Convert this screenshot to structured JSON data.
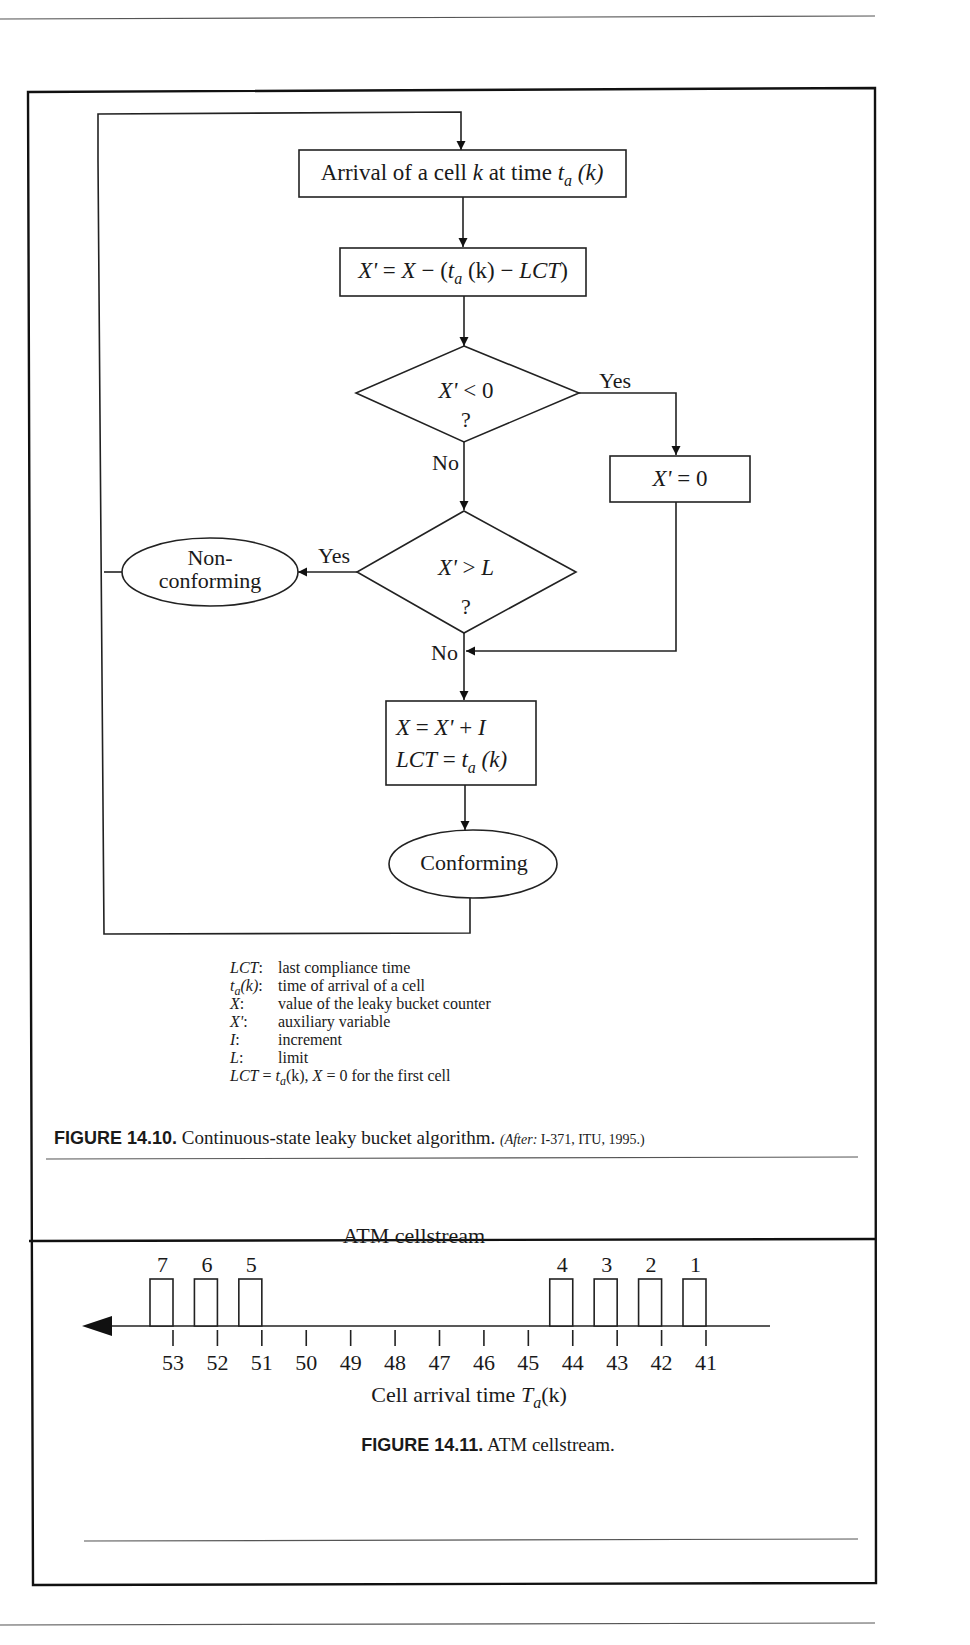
{
  "figure_14_10": {
    "nodes": {
      "arrival": {
        "pre": "Arrival of a cell ",
        "k": "k",
        "mid": " at time ",
        "t": "t",
        "sub": "a",
        "post": " (k)"
      },
      "compute": {
        "xp": "X'",
        "eq": " = ",
        "x": "X",
        "minus": " − (",
        "t": "t",
        "sub": "a",
        "k": " (k) − ",
        "lct": "LCT",
        "close": ")"
      },
      "decision1": {
        "lhs": "X'",
        "op": " < 0",
        "q": "?"
      },
      "reset": {
        "lhs": "X'",
        "rhs": " = 0"
      },
      "decision2": {
        "lhs": "X'",
        "op": " > ",
        "rhs": "L",
        "q": "?"
      },
      "update": {
        "line1": {
          "x": "X",
          "eq": " = ",
          "xp": "X'",
          "plus": " + ",
          "i": "I"
        },
        "line2": {
          "lct": "LCT",
          "eq": " = ",
          "t": "t",
          "sub": "a",
          "k": " (k)"
        }
      },
      "nonconforming": {
        "line1": "Non-",
        "line2": "conforming"
      },
      "conforming": {
        "label": "Conforming"
      }
    },
    "edge_labels": {
      "d1_yes": "Yes",
      "d1_no": "No",
      "d2_yes": "Yes",
      "d2_no": "No"
    },
    "legend": [
      {
        "sym": "LCT",
        "colon": ":",
        "desc": "last compliance time"
      },
      {
        "sym": "t",
        "sub": "a",
        "arg": "(k)",
        "colon": ":",
        "desc": "time of arrival of a cell"
      },
      {
        "sym": "X",
        "colon": ":",
        "desc": "value of the leaky bucket counter"
      },
      {
        "sym": "X'",
        "colon": ":",
        "desc": "auxiliary variable"
      },
      {
        "sym": "I",
        "colon": ":",
        "desc": "increment"
      },
      {
        "sym": "L",
        "colon": ":",
        "desc": "limit"
      }
    ],
    "legend_footer": {
      "lct": "LCT",
      "eq1": " = ",
      "t": "t",
      "sub": "a",
      "arg": "(k), ",
      "x": "X",
      "rest": " = 0 for the first cell"
    },
    "caption": {
      "label": "FIGURE 14.10.",
      "text": " Continuous-state leaky bucket algorithm. ",
      "after_label": "(After:",
      "after_text": " I-371, ITU, 1995.)"
    }
  },
  "figure_14_11": {
    "caption": {
      "label": "FIGURE 14.11.",
      "text": " ATM cellstream."
    }
  },
  "chart_data": {
    "type": "timeline",
    "title": "ATM cellstream",
    "xlabel": "Cell arrival time T_a(k)",
    "xlabel_parts": {
      "pre": "Cell arrival time ",
      "T": "T",
      "sub": "a",
      "post": "(k)"
    },
    "direction": "right-to-left (arrow points left)",
    "ticks": [
      53,
      52,
      51,
      50,
      49,
      48,
      47,
      46,
      45,
      44,
      43,
      42,
      41
    ],
    "cells": [
      {
        "id": "7",
        "time": 53
      },
      {
        "id": "6",
        "time": 52
      },
      {
        "id": "5",
        "time": 51
      },
      {
        "id": "4",
        "time": 44
      },
      {
        "id": "3",
        "time": 43
      },
      {
        "id": "2",
        "time": 42
      },
      {
        "id": "1",
        "time": 41
      }
    ],
    "grid": false,
    "legend": null
  }
}
